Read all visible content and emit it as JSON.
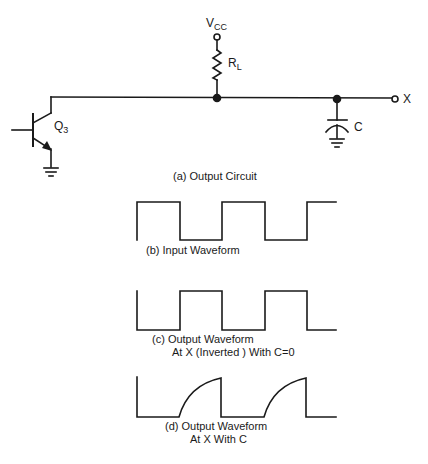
{
  "circuit": {
    "vcc_label": "V",
    "vcc_sub": "CC",
    "resistor_label": "R",
    "resistor_sub": "L",
    "transistor_label": "Q",
    "transistor_sub": "3",
    "capacitor_label": "C",
    "output_node_label": "X",
    "caption": "(a)  Output Circuit"
  },
  "waveforms": [
    {
      "id": "b",
      "caption_line1": "(b) Input Waveform",
      "caption_line2": ""
    },
    {
      "id": "c",
      "caption_line1": "(c) Output Waveform",
      "caption_line2": "At X (Inverted ) With C=0"
    },
    {
      "id": "d",
      "caption_line1": "(d)   Output Waveform",
      "caption_line2": "At X With C"
    }
  ],
  "colors": {
    "ink": "#1a1a1a",
    "background": "#ffffff"
  }
}
